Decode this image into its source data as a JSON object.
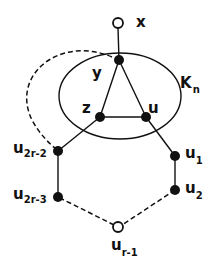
{
  "diagram": {
    "stroke_color": "#111111",
    "background": "#ffffff",
    "clique_label": {
      "main": "K",
      "sub": "n"
    },
    "nodes": {
      "x": {
        "main": "x",
        "sub": "",
        "filled": false
      },
      "y": {
        "main": "y",
        "sub": "",
        "filled": true
      },
      "z": {
        "main": "z",
        "sub": "",
        "filled": true
      },
      "u": {
        "main": "u",
        "sub": "",
        "filled": true
      },
      "u1": {
        "main": "u",
        "sub": "1",
        "filled": true
      },
      "u2": {
        "main": "u",
        "sub": "2",
        "filled": true
      },
      "ur1": {
        "main": "u",
        "sub": "r-1",
        "filled": false
      },
      "u2r3": {
        "main": "u",
        "sub": "2r-3",
        "filled": true
      },
      "u2r2": {
        "main": "u",
        "sub": "2r-2",
        "filled": true
      }
    },
    "edges": [
      {
        "from": "x",
        "to": "y",
        "style": "solid"
      },
      {
        "from": "y",
        "to": "z",
        "style": "solid"
      },
      {
        "from": "y",
        "to": "u",
        "style": "solid"
      },
      {
        "from": "z",
        "to": "u",
        "style": "solid"
      },
      {
        "from": "z",
        "to": "u2r2",
        "style": "solid"
      },
      {
        "from": "u",
        "to": "u1",
        "style": "solid"
      },
      {
        "from": "u1",
        "to": "u2",
        "style": "solid"
      },
      {
        "from": "u2",
        "to": "ur1",
        "style": "dashed"
      },
      {
        "from": "ur1",
        "to": "u2r3",
        "style": "dashed"
      },
      {
        "from": "u2r3",
        "to": "u2r2",
        "style": "solid"
      },
      {
        "from": "y",
        "to": "u2r2",
        "style": "dashed-arc"
      }
    ]
  }
}
